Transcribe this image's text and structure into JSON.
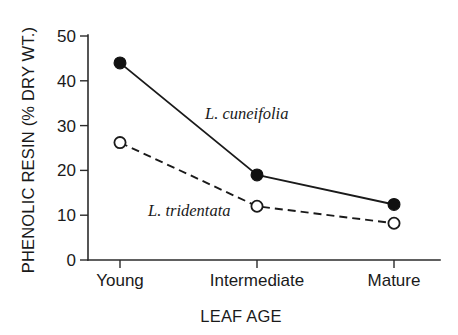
{
  "chart_data": {
    "type": "line",
    "title": "",
    "subtitle": "",
    "xlabel": "LEAF AGE",
    "ylabel": "PHENOLIC RESIN (% DRY WT.)",
    "categories": [
      "Young",
      "Intermediate",
      "Mature"
    ],
    "series": [
      {
        "name": "L. cuneifolia",
        "values": [
          44.0,
          19.0,
          12.4
        ],
        "line_style": "solid",
        "marker": "filled-circle",
        "color": "#1a1a1a"
      },
      {
        "name": "L. tridentata",
        "values": [
          26.2,
          12.0,
          8.2
        ],
        "line_style": "dashed",
        "marker": "open-circle",
        "color": "#1a1a1a"
      }
    ],
    "ylim": [
      0,
      50
    ],
    "yticks": [
      0,
      10,
      20,
      30,
      40,
      50
    ],
    "ytick_labels": [
      "0",
      "10",
      "20",
      "30",
      "40",
      "50"
    ],
    "xtick_labels": [
      "Young",
      "Intermediate",
      "Mature"
    ],
    "grid": false,
    "legend": "inline-annotations",
    "annotations": [
      {
        "text": "L. cuneifolia",
        "x": 205,
        "y": 119
      },
      {
        "text": "L. tridentata",
        "x": 148,
        "y": 216
      }
    ]
  },
  "geometry": {
    "plot_left": 88,
    "plot_right": 440,
    "plot_top": 36,
    "plot_bottom": 260,
    "category_x": [
      120,
      257,
      394
    ],
    "y_for_zero": 260,
    "px_per_unit": 4.48
  }
}
